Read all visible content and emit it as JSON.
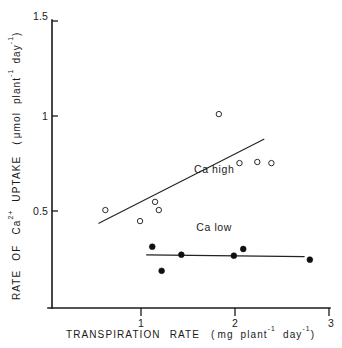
{
  "chart_data": {
    "type": "scatter",
    "title": "",
    "subtitle": "",
    "xlabel": "TRANSPIRATION   RATE   ( mg  plant⁻¹  day⁻¹ )",
    "xlabel_parts": {
      "word1": "TRANSPIRATION",
      "word2": "RATE",
      "open_paren": "(",
      "unit1": "mg",
      "unit2": "plant",
      "unit2_sup": "-1",
      "unit3": "day",
      "unit3_sup": "-1",
      "close_paren": ")"
    },
    "ylabel": "RATE  OF  Ca²⁺  UPTAKE  ( μmol  plant⁻¹ day⁻¹ )",
    "ylabel_parts": {
      "word1": "RATE",
      "word2": "OF",
      "ion": "Ca",
      "ion_sup": "2+",
      "word3": "UPTAKE",
      "open_paren": "(",
      "unit1": "μmol",
      "unit2": "plant",
      "unit2_sup": "-1",
      "unit3": "day",
      "unit3_sup": "-1",
      "close_paren": ")"
    },
    "xlim": [
      0.05,
      3.0
    ],
    "ylim": [
      0.0,
      1.5
    ],
    "xticks": [
      1,
      2,
      3
    ],
    "xtick_labels": [
      "1",
      "2",
      "3"
    ],
    "yticks": [
      0.5,
      1,
      1.5
    ],
    "ytick_labels": [
      "0.5",
      "1",
      "1.5"
    ],
    "grid": false,
    "legend_position": "inline-annotation",
    "series": [
      {
        "name": "Ca high",
        "marker": "open-circle",
        "annotation": "Ca  high",
        "annotation_x": 1.78,
        "annotation_y": 0.7,
        "points": [
          {
            "x": 0.62,
            "y": 0.505
          },
          {
            "x": 0.99,
            "y": 0.447
          },
          {
            "x": 1.15,
            "y": 0.548
          },
          {
            "x": 1.19,
            "y": 0.505
          },
          {
            "x": 1.83,
            "y": 1.01
          },
          {
            "x": 2.05,
            "y": 0.752
          },
          {
            "x": 2.24,
            "y": 0.758
          },
          {
            "x": 2.39,
            "y": 0.752
          }
        ],
        "fit_line": {
          "x1": 0.55,
          "y1": 0.436,
          "x2": 2.31,
          "y2": 0.878
        }
      },
      {
        "name": "Ca low",
        "marker": "filled-circle",
        "annotation": "Ca   low",
        "annotation_x": 1.78,
        "annotation_y": 0.395,
        "points": [
          {
            "x": 1.12,
            "y": 0.312
          },
          {
            "x": 1.22,
            "y": 0.185
          },
          {
            "x": 1.43,
            "y": 0.27
          },
          {
            "x": 1.99,
            "y": 0.265
          },
          {
            "x": 2.09,
            "y": 0.3
          },
          {
            "x": 2.8,
            "y": 0.244
          }
        ],
        "fit_line": {
          "x1": 1.06,
          "y1": 0.269,
          "x2": 2.74,
          "y2": 0.26
        }
      }
    ]
  }
}
